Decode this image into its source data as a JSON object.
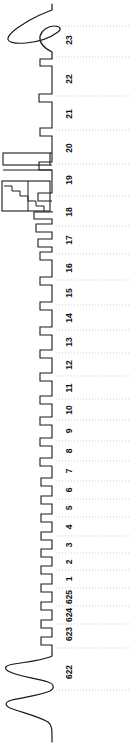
{
  "chart_data": {
    "type": "line",
    "title": "",
    "subtitle": "",
    "orientation": "rotated-90",
    "xlabel": "",
    "ylabel": "",
    "grid": true,
    "legend": null,
    "axis": {
      "baseline_px": 52,
      "tick_labels": [
        "23",
        "22",
        "21",
        "20",
        "19",
        "18",
        "17",
        "16",
        "15",
        "14",
        "13",
        "12",
        "11",
        "10",
        "9",
        "8",
        "7",
        "6",
        "5",
        "4",
        "3",
        "2",
        "1",
        "625",
        "624",
        "623",
        "622"
      ],
      "tick_positions_px": [
        40,
        79,
        114,
        148,
        180,
        212,
        240,
        268,
        293,
        318,
        342,
        365,
        388,
        410,
        431,
        451,
        471,
        490,
        508,
        527,
        545,
        562,
        579,
        597,
        615,
        634,
        672
      ],
      "gridline_color": "#b9b9b9",
      "trace_color": "#1a1a1a",
      "background_color": "#ffffff"
    },
    "ticks": [
      {
        "label": "23",
        "y": 40
      },
      {
        "label": "22",
        "y": 79
      },
      {
        "label": "21",
        "y": 114
      },
      {
        "label": "20",
        "y": 148
      },
      {
        "label": "19",
        "y": 180
      },
      {
        "label": "18",
        "y": 212
      },
      {
        "label": "17",
        "y": 240
      },
      {
        "label": "16",
        "y": 268
      },
      {
        "label": "15",
        "y": 293
      },
      {
        "label": "14",
        "y": 318
      },
      {
        "label": "13",
        "y": 342
      },
      {
        "label": "12",
        "y": 365
      },
      {
        "label": "11",
        "y": 388
      },
      {
        "label": "10",
        "y": 410
      },
      {
        "label": "9",
        "y": 431
      },
      {
        "label": "8",
        "y": 451
      },
      {
        "label": "7",
        "y": 471
      },
      {
        "label": "6",
        "y": 490
      },
      {
        "label": "5",
        "y": 508
      },
      {
        "label": "4",
        "y": 527
      },
      {
        "label": "3",
        "y": 545
      },
      {
        "label": "2",
        "y": 562
      },
      {
        "label": "1",
        "y": 579
      },
      {
        "label": "625",
        "y": 597
      },
      {
        "label": "624",
        "y": 615
      },
      {
        "label": "623",
        "y": 634
      },
      {
        "label": "622",
        "y": 672
      }
    ],
    "gridlines_y": [
      26,
      57,
      96,
      130,
      164,
      196,
      226,
      254,
      280,
      305,
      330,
      353,
      376,
      399,
      420,
      441,
      461,
      481,
      499,
      517,
      536,
      553,
      570,
      588,
      606,
      624,
      648,
      690
    ],
    "pulses": [
      {
        "center_y": 62,
        "width": 8,
        "amplitude": 30
      },
      {
        "center_y": 98,
        "width": 8,
        "amplitude": 32
      },
      {
        "center_y": 132,
        "width": 8,
        "amplitude": 30
      },
      {
        "center_y": 166,
        "width": 8,
        "amplitude": 31
      },
      {
        "center_y": 197,
        "width": 9,
        "amplitude": 30
      },
      {
        "center_y": 213,
        "width": 16,
        "amplitude": 52
      },
      {
        "center_y": 228,
        "width": 10,
        "amplitude": 50
      },
      {
        "center_y": 243,
        "width": 9,
        "amplitude": 50
      },
      {
        "center_y": 256,
        "width": 8,
        "amplitude": 30
      },
      {
        "center_y": 281,
        "width": 8,
        "amplitude": 30
      },
      {
        "center_y": 306,
        "width": 8,
        "amplitude": 30
      },
      {
        "center_y": 331,
        "width": 8,
        "amplitude": 30
      },
      {
        "center_y": 354,
        "width": 8,
        "amplitude": 30
      },
      {
        "center_y": 377,
        "width": 8,
        "amplitude": 30
      },
      {
        "center_y": 400,
        "width": 8,
        "amplitude": 30
      },
      {
        "center_y": 421,
        "width": 8,
        "amplitude": 30
      },
      {
        "center_y": 442,
        "width": 8,
        "amplitude": 30
      },
      {
        "center_y": 462,
        "width": 8,
        "amplitude": 30
      },
      {
        "center_y": 482,
        "width": 8,
        "amplitude": 28
      },
      {
        "center_y": 500,
        "width": 8,
        "amplitude": 28
      },
      {
        "center_y": 518,
        "width": 8,
        "amplitude": 28
      },
      {
        "center_y": 536,
        "width": 8,
        "amplitude": 28
      },
      {
        "center_y": 553,
        "width": 8,
        "amplitude": 28
      },
      {
        "center_y": 570,
        "width": 8,
        "amplitude": 28
      },
      {
        "center_y": 588,
        "width": 8,
        "amplitude": 28
      },
      {
        "center_y": 606,
        "width": 8,
        "amplitude": 28
      },
      {
        "center_y": 624,
        "width": 8,
        "amplitude": 28
      },
      {
        "center_y": 641,
        "width": 8,
        "amplitude": 28
      }
    ],
    "smooth_events": [
      {
        "name": "top-large-excursion",
        "y_start": 8,
        "y_end": 58,
        "peak_amplitude": 46
      },
      {
        "name": "bottom-large-oscillation",
        "y_start": 652,
        "y_end": 718,
        "peak_amplitude": 50
      }
    ],
    "staircase_region": {
      "label_range": "17",
      "y_top": 181,
      "y_bottom": 213,
      "x_left": 2,
      "x_right": 50,
      "steps": 6
    },
    "wide_pulse_region": {
      "label_range": "18",
      "y_top": 153,
      "y_bottom": 178,
      "x_left": 3,
      "x_right": 50
    }
  },
  "figure": {
    "caption": ""
  }
}
